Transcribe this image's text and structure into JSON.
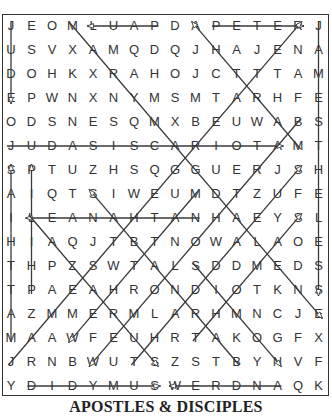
{
  "puzzle": {
    "title": "APOSTLES & DISCIPLES",
    "rows": [
      "JEOMLUAPDAPETERJ",
      "USVXAMQDQJHAJENA",
      "DOHKXRAHOJCTTTAM",
      "EPWNXNYMSMTARHFE",
      "ODSNESQMXBEUWABS",
      "JUDASISCARIOTAMT",
      "SPTUZHSQGGUERJSH",
      "AIQTSIWEUMDTZUFE",
      "ILEANAHTANHAEYSL",
      "HIAQJTBTNOWALAOE",
      "THPZSWTALSDDMEDS",
      "TPAEAHRONDIOTKNS",
      "AZMMERMLARHMNCJE",
      "MAAWFEUHRTAKOGFX",
      "JRNBWUTSZSTBYNVF",
      "YDIDYMUSWERDNAQK"
    ],
    "found_words": [
      {
        "word": "JUDE",
        "from": [
          0,
          0
        ],
        "to": [
          0,
          3
        ]
      },
      {
        "word": "PAUL",
        "from": [
          7,
          0
        ],
        "to": [
          4,
          0
        ]
      },
      {
        "word": "PETER",
        "from": [
          10,
          0
        ],
        "to": [
          14,
          0
        ]
      },
      {
        "word": "JAMES THE LESS",
        "from": [
          15,
          0
        ],
        "to": [
          15,
          11
        ]
      },
      {
        "word": "MARY MAGDALENE",
        "from": [
          3,
          0
        ],
        "to": [
          15,
          12
        ]
      },
      {
        "word": "MARTHA",
        "from": [
          14,
          5
        ],
        "to": [
          9,
          0
        ]
      },
      {
        "word": "JAMES THE GREATER",
        "from": [
          0,
          14
        ],
        "to": [
          14,
          0
        ]
      },
      {
        "word": "JUDAS ISCARIOT",
        "from": [
          0,
          5
        ],
        "to": [
          13,
          5
        ]
      },
      {
        "word": "MATTHIAS",
        "from": [
          0,
          13
        ],
        "to": [
          0,
          6
        ]
      },
      {
        "word": "PHILIP",
        "from": [
          1,
          11
        ],
        "to": [
          1,
          6
        ]
      },
      {
        "word": "NATHANAEL",
        "from": [
          9,
          8
        ],
        "to": [
          1,
          8
        ]
      },
      {
        "word": "LAZARUS",
        "from": [
          1,
          8
        ],
        "to": [
          7,
          14
        ]
      },
      {
        "word": "BARNABAS",
        "from": [
          11,
          14
        ],
        "to": [
          4,
          7
        ]
      },
      {
        "word": "SIMON",
        "from": [
          9,
          10
        ],
        "to": [
          13,
          14
        ]
      },
      {
        "word": "BARTHOLOMEW",
        "from": [
          14,
          4
        ],
        "to": [
          4,
          14
        ]
      },
      {
        "word": "MATTHEW",
        "from": [
          9,
          7
        ],
        "to": [
          3,
          13
        ]
      },
      {
        "word": "THOMAS",
        "from": [
          9,
          13
        ],
        "to": [
          14,
          8
        ]
      },
      {
        "word": "THADDEUS",
        "from": [
          6,
          14
        ],
        "to": [
          14,
          6
        ]
      },
      {
        "word": "DIDYMUS",
        "from": [
          1,
          15
        ],
        "to": [
          7,
          15
        ]
      },
      {
        "word": "ANDREW",
        "from": [
          13,
          15
        ],
        "to": [
          8,
          15
        ]
      }
    ],
    "colors": {
      "line": "#3a3a3a",
      "letter": "#333333",
      "border": "#333333"
    }
  }
}
